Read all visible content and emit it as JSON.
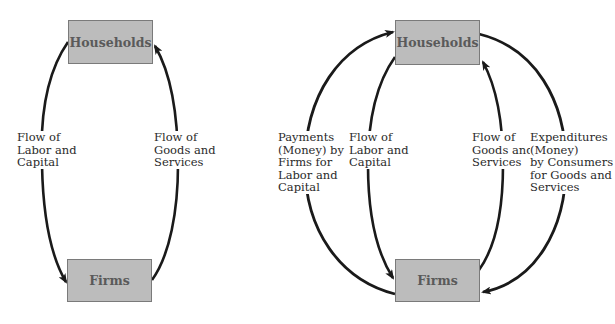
{
  "left_diagram": {
    "households_label": "Households",
    "firms_label": "Firms",
    "flow_labor_capital": "Flow of\nLabor and\nCapital",
    "flow_goods_services": "Flow of\nGoods and\nServices"
  },
  "right_diagram": {
    "households_label": "Households",
    "firms_label": "Firms",
    "payments_label": "Payments\n(Money) by\nFirms for\nLabor and\nCapital",
    "flow_labor_capital": "Flow of\nLabor and\nCapital",
    "flow_goods_services": "Flow of\nGoods and\nServices",
    "expenditures_label": "Expenditures\n(Money)\nby Consumers\nfor Goods and\nServices"
  },
  "colors": {
    "box_fill": "#bcbcbc",
    "box_border": "#7a7a7a",
    "arrow": "#1a1a1a"
  }
}
